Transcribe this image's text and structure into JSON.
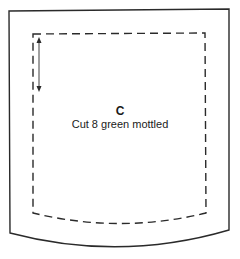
{
  "pattern_piece": {
    "letter": "C",
    "instructions": "Cut 8 green mottled",
    "colors": {
      "line": "#2a2a2a",
      "background": "#ffffff"
    },
    "elements": {
      "outer_cut_line": "solid",
      "seam_line": "dashed",
      "grain_arrow": "double-headed-vertical"
    }
  }
}
